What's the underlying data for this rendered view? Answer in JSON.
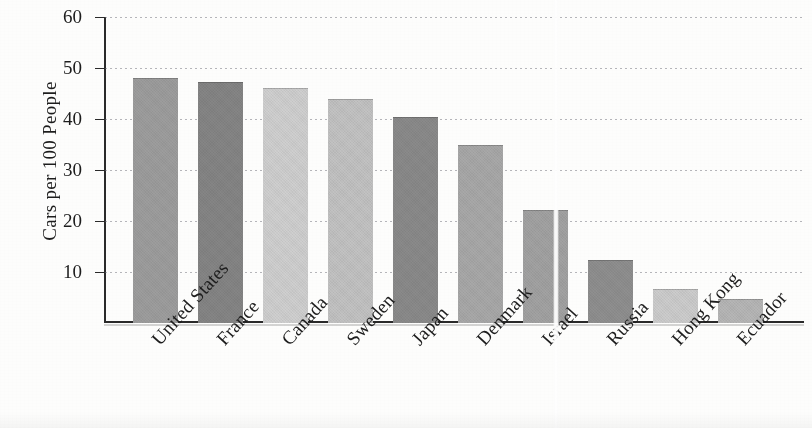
{
  "chart_data": {
    "type": "bar",
    "title": "",
    "subtitle": "",
    "xlabel": "",
    "ylabel": "Cars per 100 People",
    "ylim": [
      0,
      60
    ],
    "ytick_values": [
      10,
      20,
      30,
      40,
      50,
      60
    ],
    "ytick_labels": [
      "10",
      "20",
      "30",
      "40",
      "50",
      "60"
    ],
    "grid": true,
    "legend": false,
    "legend_position": "none",
    "categories": [
      "United States",
      "France",
      "Canada",
      "Sweden",
      "Japan",
      "Denmark",
      "Israel",
      "Russia",
      "Hong Kong",
      "Ecuador"
    ],
    "values": [
      48,
      47.2,
      46,
      44,
      40.4,
      35,
      22.2,
      12.4,
      6.7,
      4.8
    ],
    "bar_colors": [
      "#9d9d9d",
      "#858585",
      "#cfcfcf",
      "#c2c2c2",
      "#8a8a8a",
      "#a8a8a8",
      "#a2a2a2",
      "#8f8f8f",
      "#cccccc",
      "#b6b6b6"
    ],
    "axis_color": "#2a2a2a",
    "grid_color": "#6e6e78",
    "text_color": "#1d1d1d",
    "background_color": "#fdfdfc"
  },
  "figure": {
    "x_label_rotation_deg": -48,
    "first_label_clipped": true
  }
}
